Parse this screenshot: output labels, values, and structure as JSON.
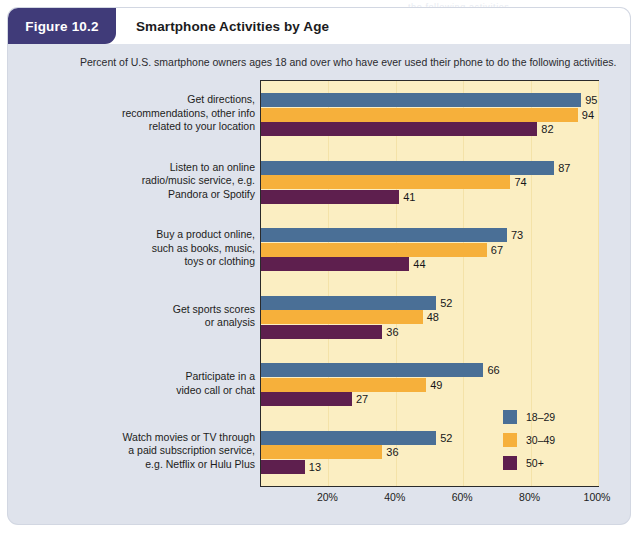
{
  "figure": {
    "badge": "Figure 10.2",
    "title": "Smartphone Activities by Age",
    "subtitle": "Percent of U.S. smartphone owners ages 18 and over who have ever used their phone to do the following activities."
  },
  "chart_data": {
    "type": "bar",
    "orientation": "horizontal",
    "title": "Smartphone Activities by Age",
    "subtitle": "Percent of U.S. smartphone owners ages 18 and over who have ever used their phone to do the following activities.",
    "xlabel": "",
    "ylabel": "",
    "xlim": [
      0,
      100
    ],
    "xticks": [
      "20%",
      "40%",
      "60%",
      "80%",
      "100%"
    ],
    "xtick_values": [
      20,
      40,
      60,
      80,
      100
    ],
    "grid": true,
    "legend_position": "inside-right-lower",
    "categories": [
      "Get directions, recommendations, other info related to your location",
      "Listen to an online radio/music service, e.g. Pandora or Spotify",
      "Buy a product online, such as books, music, toys or clothing",
      "Get sports scores or analysis",
      "Participate in a video call or chat",
      "Watch movies or TV through a paid subscription service, e.g. Netflix or Hulu Plus"
    ],
    "category_lines": [
      [
        "Get directions,",
        "recommendations, other info",
        "related to your location"
      ],
      [
        "Listen to an online",
        "radio/music service, e.g.",
        "Pandora or Spotify"
      ],
      [
        "Buy a product online,",
        "such as books, music,",
        "toys or clothing"
      ],
      [
        "Get sports scores",
        "or analysis"
      ],
      [
        "Participate in a",
        "video call or chat"
      ],
      [
        "Watch movies or TV through",
        "a paid subscription service,",
        "e.g. Netflix or Hulu Plus"
      ]
    ],
    "series": [
      {
        "name": "18–29",
        "color": "#4a6f96",
        "values": [
          95,
          87,
          73,
          52,
          66,
          52
        ]
      },
      {
        "name": "30–49",
        "color": "#f6b03b",
        "values": [
          94,
          74,
          67,
          48,
          49,
          36
        ]
      },
      {
        "name": "50+",
        "color": "#5e1f4e",
        "values": [
          82,
          41,
          44,
          36,
          27,
          13
        ]
      }
    ],
    "legend": [
      {
        "label": "18–29",
        "color": "#4a6f96"
      },
      {
        "label": "30–49",
        "color": "#f6b03b"
      },
      {
        "label": "50+",
        "color": "#5e1f4e"
      }
    ]
  },
  "bleed_text": "the following activities."
}
